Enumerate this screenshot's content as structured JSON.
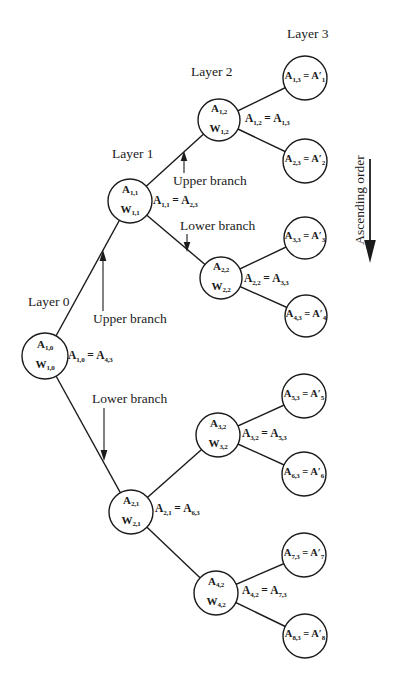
{
  "colors": {
    "ink": "#1b1b1b",
    "background": "#ffffff"
  },
  "layer_labels": {
    "layer0": "Layer 0",
    "layer1": "Layer 1",
    "layer2": "Layer 2",
    "layer3": "Layer 3"
  },
  "branch_annotations": {
    "layer0_upper": "Upper branch",
    "layer0_lower": "Lower branch",
    "layer1_upper": "Upper branch",
    "layer1_lower": "Lower branch"
  },
  "side_annotation": "Ascending order",
  "internal_nodes": {
    "a1_0": {
      "top": "A_{1,0}",
      "bottom": "W_{1,0}",
      "equation": "A_{1,0} = A_{4,3}"
    },
    "a1_1": {
      "top": "A_{1,1}",
      "bottom": "W_{1,1}",
      "equation": "A_{1,1} = A_{2,3}"
    },
    "a2_1": {
      "top": "A_{2,1}",
      "bottom": "W_{2,1}",
      "equation": "A_{2,1} = A_{6,3}"
    },
    "a1_2": {
      "top": "A_{1,2}",
      "bottom": "W_{1,2}",
      "equation": "A_{1,2} = A_{1,3}"
    },
    "a2_2": {
      "top": "A_{2,2}",
      "bottom": "W_{2,2}",
      "equation": "A_{2,2} = A_{3,3}"
    },
    "a3_2": {
      "top": "A_{3,2}",
      "bottom": "W_{3,2}",
      "equation": "A_{3,2} = A_{5,3}"
    },
    "a4_2": {
      "top": "A_{4,2}",
      "bottom": "W_{4,2}",
      "equation": "A_{4,2} = A_{7,3}"
    }
  },
  "leaf_nodes": [
    "A_{1,3} = A′_{1}",
    "A_{2,3} = A′_{2}",
    "A_{3,3} = A′_{3}",
    "A_{4,3} = A′_{4}",
    "A_{5,3} = A′_{5}",
    "A_{6,3} = A′_{6}",
    "A_{7,3} = A′_{7}",
    "A_{8,3} = A′_{8}"
  ]
}
